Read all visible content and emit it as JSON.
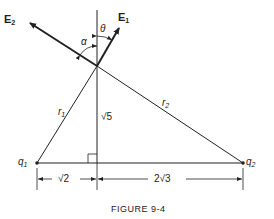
{
  "figure": {
    "caption": "FIGURE 9-4",
    "vectors": {
      "E1": {
        "base": "E",
        "sub": "1"
      },
      "E2": {
        "base": "E",
        "sub": "2"
      }
    },
    "angles": {
      "alpha": "α",
      "theta": "θ"
    },
    "distances": {
      "r1": {
        "base": "r",
        "sub": "1"
      },
      "r2": {
        "base": "r",
        "sub": "2"
      }
    },
    "charges": {
      "q1": {
        "base": "q",
        "sub": "1"
      },
      "q2": {
        "base": "q",
        "sub": "2"
      }
    },
    "dimensions": {
      "height": "√5",
      "left_base": "√2",
      "right_base": "2√3"
    }
  }
}
